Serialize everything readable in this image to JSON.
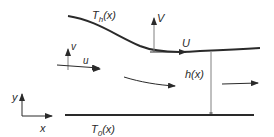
{
  "diagram": {
    "type": "thin-film flow schematic",
    "labels": {
      "top_wall_temperature": "T",
      "top_wall_temperature_sub": "h",
      "top_wall_temperature_arg": "(x)",
      "bottom_wall_temperature": "T",
      "bottom_wall_temperature_sub": "0",
      "bottom_wall_temperature_arg": "(x)",
      "wall_velocity_normal": "V",
      "wall_velocity_tangential": "U",
      "fluid_velocity_normal": "v",
      "fluid_velocity_tangential": "u",
      "gap_height": "h(x)",
      "axis_x": "x",
      "axis_y": "y"
    },
    "colors": {
      "stroke": "#2a2a2a",
      "thin_line": "#808080",
      "background": "#ffffff"
    }
  }
}
